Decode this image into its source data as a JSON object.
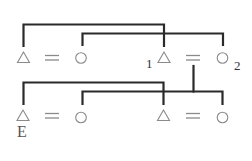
{
  "diagram": {
    "type": "kinship-diagram",
    "symbol_legend": {
      "triangle": "male",
      "circle": "female",
      "equals": "marriage"
    },
    "colors": {
      "line": "#2a2a2a",
      "symbol": "#8a8a8a",
      "background": "#ffffff"
    },
    "rows": [
      {
        "name": "upper-generation",
        "couples": [
          {
            "husband": {
              "shape": "triangle",
              "label": ""
            },
            "wife": {
              "shape": "circle",
              "label": ""
            }
          },
          {
            "husband": {
              "shape": "triangle",
              "label": "1"
            },
            "wife": {
              "shape": "circle",
              "label": "2"
            }
          }
        ]
      },
      {
        "name": "lower-generation",
        "couples": [
          {
            "husband": {
              "shape": "triangle",
              "label": "E"
            },
            "wife": {
              "shape": "circle",
              "label": ""
            }
          },
          {
            "husband": {
              "shape": "triangle",
              "label": ""
            },
            "wife": {
              "shape": "circle",
              "label": ""
            }
          }
        ]
      }
    ],
    "connections": [
      {
        "name": "upper-left-man-to-man-1",
        "from": "row0.couple0.husband",
        "to": "row0.couple1.husband"
      },
      {
        "name": "upper-left-woman-to-woman-2",
        "from": "row0.couple0.wife",
        "to": "row0.couple1.wife"
      },
      {
        "name": "couple-1-2-descent",
        "from": "row0.couple1.marriage",
        "to": "row1.line"
      },
      {
        "name": "lower-ego-to-right-man",
        "from": "row1.couple0.husband",
        "to": "row1.couple1.husband"
      },
      {
        "name": "lower-left-woman-to-right-woman",
        "from": "row1.couple0.wife",
        "to": "row1.couple1.wife"
      }
    ],
    "labels": {
      "ego": "E",
      "person_1": "1",
      "person_2": "2"
    }
  }
}
